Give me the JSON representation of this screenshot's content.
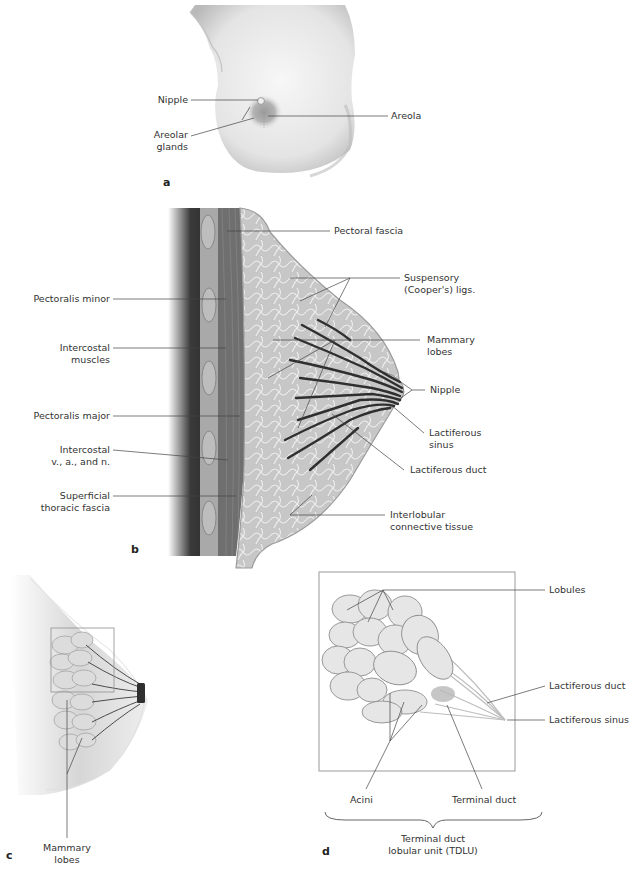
{
  "figure": {
    "panels": {
      "a": {
        "letter": "a",
        "labels": {
          "nipple": "Nipple",
          "areola": "Areola",
          "areolar_glands_l1": "Areolar",
          "areolar_glands_l2": "glands"
        }
      },
      "b": {
        "letter": "b",
        "labels": {
          "pectoral_fascia": "Pectoral fascia",
          "suspensory_l1": "Suspensory",
          "suspensory_l2": "(Cooper's) ligs.",
          "pectoralis_minor": "Pectoralis minor",
          "intercostal_muscles_l1": "Intercostal",
          "intercostal_muscles_l2": "muscles",
          "mammary_lobes_l1": "Mammary",
          "mammary_lobes_l2": "lobes",
          "nipple": "Nipple",
          "pectoralis_major": "Pectoralis major",
          "lactiferous_sinus_l1": "Lactiferous",
          "lactiferous_sinus_l2": "sinus",
          "intercostal_van_l1": "Intercostal",
          "intercostal_van_l2": "v., a., and n.",
          "lactiferous_duct": "Lactiferous duct",
          "superficial_fascia_l1": "Superficial",
          "superficial_fascia_l2": "thoracic fascia",
          "interlobular_l1": "Interlobular",
          "interlobular_l2": "connective tissue"
        }
      },
      "c": {
        "letter": "c",
        "labels": {
          "mammary_lobes_l1": "Mammary",
          "mammary_lobes_l2": "lobes"
        }
      },
      "d": {
        "letter": "d",
        "labels": {
          "lobules": "Lobules",
          "lactiferous_duct": "Lactiferous duct",
          "lactiferous_sinus": "Lactiferous sinus",
          "acini": "Acini",
          "terminal_duct": "Terminal duct",
          "tdlu_l1": "Terminal duct",
          "tdlu_l2": "lobular unit (TDLU)"
        }
      }
    },
    "colors": {
      "background": "#ffffff",
      "skin": "#e8e8e8",
      "tissue": "#c9c9c9",
      "muscle": "#7a7a7a",
      "duct": "#3a3a3a",
      "leader_line": "#444444",
      "frame": "#9a9a9a"
    }
  }
}
